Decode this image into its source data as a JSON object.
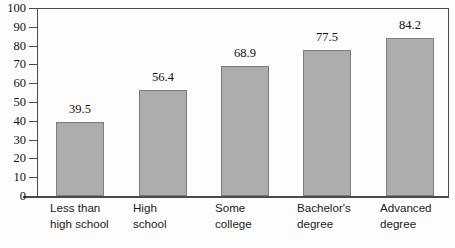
{
  "chart_data": {
    "type": "bar",
    "title": "",
    "subtitle": "",
    "xlabel": "",
    "ylabel": "",
    "categories": [
      "Less than high school",
      "High school",
      "Some college",
      "Bachelor's degree",
      "Advanced degree"
    ],
    "category_lines": [
      [
        "Less than",
        "high school"
      ],
      [
        "High",
        "school"
      ],
      [
        "Some",
        "college"
      ],
      [
        "Bachelor's",
        "degree"
      ],
      [
        "Advanced",
        "degree"
      ]
    ],
    "values": [
      39.5,
      56.4,
      68.9,
      77.5,
      84.2
    ],
    "value_labels": [
      "39.5",
      "56.4",
      "68.9",
      "77.5",
      "84.2"
    ],
    "ylim": [
      0,
      100
    ],
    "ytick_step": 10,
    "ytick_labels": [
      "100",
      "90",
      "80",
      "70",
      "60",
      "50",
      "40",
      "30",
      "20",
      "10",
      "0"
    ],
    "ytick_values": [
      100,
      90,
      80,
      70,
      60,
      50,
      40,
      30,
      20,
      10,
      0
    ],
    "grid": false,
    "legend": null,
    "legend_position": "none",
    "bar_fill_color": "#adadad",
    "bar_border_color": "#7d7d7d",
    "axis_color": "#4a4a4a",
    "text_color": "#111111",
    "background_color": "#fdfdfd"
  }
}
